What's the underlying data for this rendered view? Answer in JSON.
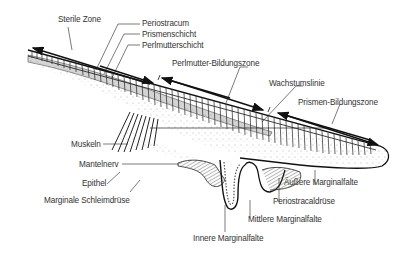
{
  "diagram": {
    "type": "cross-section of mollusc shell margin and mantle edge",
    "colors": {
      "line": "#1a1a1a",
      "text": "#333333",
      "background": "#ffffff",
      "stipple": "#666666"
    }
  },
  "labels": {
    "sterile_zone": "Sterile Zone",
    "periostracum": "Periostracum",
    "prismenschicht": "Prismenschicht",
    "perlmutterschicht": "Perlmutterschicht",
    "perlmutter_bildungszone": "Perlmutter-Bildungszone",
    "wachstumslinie": "Wachstumslinie",
    "prismen_bildungszone": "Prismen-Bildungszone",
    "muskeln": "Muskeln",
    "mantelnerv": "Mantelnerv",
    "epithel": "Epithel",
    "marginale_schleimdruese": "Marginale Schleimdrüse",
    "aeussere_marginalfalte": "Äußere Marginalfalte",
    "periostracaldruese": "Periostracaldrüse",
    "mittlere_marginalfalte": "Mittlere Marginalfalte",
    "innere_marginalfalte": "Innere Marginalfalte"
  }
}
